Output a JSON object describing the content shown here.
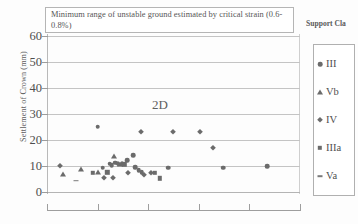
{
  "chart_data": {
    "type": "scatter",
    "title": "",
    "xlabel": "",
    "ylabel": "Settlement of Crown (mm)",
    "ylim": [
      0,
      60
    ],
    "y_ticks": [
      0,
      10,
      20,
      30,
      40,
      50,
      60
    ],
    "y_tick_labels": [
      "0",
      "10",
      "20",
      "30",
      "40",
      "50",
      "60"
    ],
    "xlim": [
      0,
      100
    ],
    "x_ticks": [
      0,
      20,
      40,
      60,
      80,
      100
    ],
    "x_tick_labels": [
      "",
      "",
      "",
      "",
      "",
      ""
    ],
    "grid": "horizontal",
    "legend_position": "right",
    "annotations": [
      {
        "name": "unstable-ground-note",
        "text": "Minimum range of unstable ground estimated by critical strain (0.6-0.8%)"
      },
      {
        "name": "tunnel-diameter-label",
        "text": "2D"
      }
    ],
    "series": [
      {
        "name": "III",
        "marker": "circle",
        "color": "#6b6b6b",
        "points": [
          {
            "x": 20.1,
            "y": 25.1
          },
          {
            "x": 22.0,
            "y": 9.3
          },
          {
            "x": 24.8,
            "y": 10.9
          },
          {
            "x": 25.6,
            "y": 10.3
          },
          {
            "x": 27.0,
            "y": 11.2
          },
          {
            "x": 31.6,
            "y": 12.3
          },
          {
            "x": 34.0,
            "y": 14.1
          },
          {
            "x": 34.8,
            "y": 9.6
          },
          {
            "x": 36.2,
            "y": 8.4
          },
          {
            "x": 37.4,
            "y": 7.6
          },
          {
            "x": 47.9,
            "y": 9.3
          },
          {
            "x": 69.6,
            "y": 9.3
          },
          {
            "x": 87.1,
            "y": 10.0
          }
        ]
      },
      {
        "name": "Vb",
        "marker": "triangle",
        "color": "#6b6b6b",
        "points": [
          {
            "x": 6.2,
            "y": 7.1
          },
          {
            "x": 13.5,
            "y": 9.0
          },
          {
            "x": 20.3,
            "y": 7.6
          },
          {
            "x": 26.5,
            "y": 14.0
          },
          {
            "x": 28.9,
            "y": 10.7
          }
        ]
      },
      {
        "name": "IV",
        "marker": "diamond",
        "color": "#6b6b6b",
        "points": [
          {
            "x": 5.1,
            "y": 10.0
          },
          {
            "x": 22.4,
            "y": 5.2
          },
          {
            "x": 26.0,
            "y": 5.2
          },
          {
            "x": 28.2,
            "y": 10.6
          },
          {
            "x": 29.6,
            "y": 10.6
          },
          {
            "x": 32.2,
            "y": 7.5
          },
          {
            "x": 37.0,
            "y": 23.1
          },
          {
            "x": 38.2,
            "y": 6.6
          },
          {
            "x": 41.0,
            "y": 7.2
          },
          {
            "x": 49.8,
            "y": 23.1
          },
          {
            "x": 60.4,
            "y": 23.1
          },
          {
            "x": 65.5,
            "y": 17.0
          }
        ]
      },
      {
        "name": "IIIa",
        "marker": "square",
        "color": "#6b6b6b",
        "points": [
          {
            "x": 18.0,
            "y": 7.5
          },
          {
            "x": 23.8,
            "y": 7.6
          },
          {
            "x": 30.6,
            "y": 10.7
          },
          {
            "x": 42.6,
            "y": 7.4
          },
          {
            "x": 44.6,
            "y": 5.2
          }
        ]
      },
      {
        "name": "Va",
        "marker": "dash",
        "color": "#7a7a7a",
        "points": [
          {
            "x": 11.4,
            "y": 4.4
          }
        ]
      }
    ]
  },
  "legend": {
    "title": "Support Cla",
    "items": [
      {
        "label": "III",
        "marker": "circle"
      },
      {
        "label": "Vb",
        "marker": "triangle"
      },
      {
        "label": "IV",
        "marker": "diamond"
      },
      {
        "label": "IIIa",
        "marker": "square"
      },
      {
        "label": "Va",
        "marker": "dash"
      }
    ]
  }
}
